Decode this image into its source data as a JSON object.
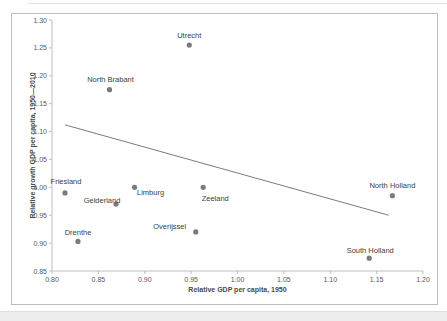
{
  "chart_data": {
    "type": "scatter",
    "title": "",
    "xlabel": "Relative GDP per capita, 1950",
    "ylabel": "Relative growth GDP per capita, 1950—2010",
    "xlim": [
      0.8,
      1.2
    ],
    "ylim": [
      0.85,
      1.3
    ],
    "x_ticks": [
      "0.80",
      "0.85",
      "0.90",
      "0.95",
      "1.00",
      "1.05",
      "1.10",
      "1.15",
      "1.20"
    ],
    "y_ticks": [
      "0.85",
      "0.90",
      "0.95",
      "1.00",
      "1.05",
      "1.10",
      "1.15",
      "1.20",
      "1.25",
      "1.30"
    ],
    "grid": false,
    "legend": false,
    "points": [
      {
        "label": "Utrecht",
        "x": 0.948,
        "y": 1.255,
        "label_dx": 0,
        "label_dy": -9.5
      },
      {
        "label": "North Brabant",
        "x": 0.862,
        "y": 1.175,
        "label_dx": 1,
        "label_dy": -10
      },
      {
        "label": "Friesland",
        "x": 0.814,
        "y": 0.99,
        "label_dx": 1,
        "label_dy": -11
      },
      {
        "label": "Gelderland",
        "x": 0.869,
        "y": 0.97,
        "label_dx": -14,
        "label_dy": -4
      },
      {
        "label": "Limburg",
        "x": 0.889,
        "y": 1.0,
        "label_dx": 16,
        "label_dy": 5
      },
      {
        "label": "Zeeland",
        "x": 0.963,
        "y": 1.0,
        "label_dx": 12,
        "label_dy": 11
      },
      {
        "label": "Overijssel",
        "x": 0.955,
        "y": 0.92,
        "label_dx": -26,
        "label_dy": -5
      },
      {
        "label": "Drenthe",
        "x": 0.828,
        "y": 0.903,
        "label_dx": 0,
        "label_dy": -9
      },
      {
        "label": "North Holland",
        "x": 1.167,
        "y": 0.985,
        "label_dx": 0,
        "label_dy": -10
      },
      {
        "label": "South Holland",
        "x": 1.142,
        "y": 0.873,
        "label_dx": 1,
        "label_dy": -8
      }
    ],
    "trendline": {
      "x1": 0.814,
      "y1": 1.112,
      "x2": 1.163,
      "y2": 0.95
    },
    "style": {
      "marker_color": "#7b7b7b",
      "marker_radius": 2.6,
      "trendline_color": "#595959",
      "axis_color": "#bfbfbf",
      "tick_label_color": "#595959",
      "point_label_color": "#404040"
    }
  }
}
